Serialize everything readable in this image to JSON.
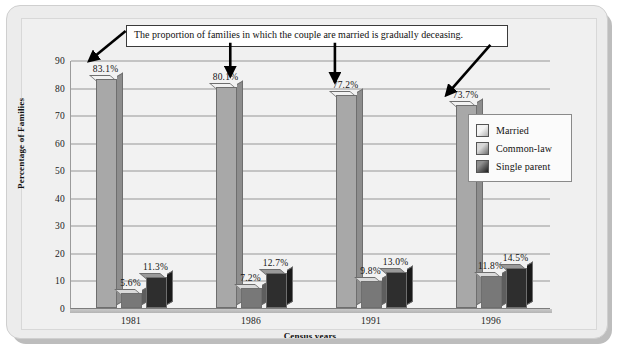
{
  "chart_data": {
    "type": "bar",
    "title": "",
    "xlabel": "Census years",
    "ylabel": "Percentage of Families",
    "categories": [
      "1981",
      "1986",
      "1991",
      "1996"
    ],
    "ylim": [
      0,
      90
    ],
    "yticks": [
      0,
      10,
      20,
      30,
      40,
      50,
      60,
      70,
      80,
      90
    ],
    "grid": true,
    "legend_position": "right",
    "series": [
      {
        "name": "Married",
        "color": "#a8a8a8",
        "values": [
          83.1,
          80.1,
          77.2,
          73.7
        ],
        "labels": [
          "83.1%",
          "80.1%",
          "77.2%",
          "73.7%"
        ]
      },
      {
        "name": "Common-law",
        "color": "#787878",
        "values": [
          5.6,
          7.2,
          9.8,
          11.8
        ],
        "labels": [
          "5.6%",
          "7.2%",
          "9.8%",
          "11.8%"
        ]
      },
      {
        "name": "Single parent",
        "color": "#2e2e2e",
        "values": [
          11.3,
          12.7,
          13.0,
          14.5
        ],
        "labels": [
          "11.3%",
          "12.7%",
          "13.0%",
          "14.5%"
        ]
      }
    ],
    "annotations": [
      {
        "text": "The proportion of families in which the couple are married is gradually deceasing.",
        "points_to": [
          "1981-married",
          "1986-married",
          "1991-married",
          "1996-married"
        ]
      }
    ]
  },
  "axis": {
    "y_ticks": [
      "90",
      "80",
      "70",
      "60",
      "50",
      "40",
      "30",
      "20",
      "10",
      "0"
    ],
    "y_title": "Percentage of Families",
    "x_ticks": [
      "1981",
      "1986",
      "1991",
      "1996"
    ],
    "x_title": "Census years"
  },
  "callout": {
    "text": "The proportion of families in which the couple are married is gradually deceasing."
  },
  "legend": {
    "items": [
      {
        "label": "Married"
      },
      {
        "label": "Common-law"
      },
      {
        "label": "Single parent"
      }
    ]
  },
  "bars": {
    "g1": {
      "married": "83.1%",
      "common": "5.6%",
      "single": "11.3%"
    },
    "g2": {
      "married": "80.1%",
      "common": "7.2%",
      "single": "12.7%"
    },
    "g3": {
      "married": "77.2%",
      "common": "9.8%",
      "single": "13.0%"
    },
    "g4": {
      "married": "73.7%",
      "common": "11.8%",
      "single": "14.5%"
    }
  },
  "colors": {
    "married": "#a8a8a8",
    "common_law": "#787878",
    "single_parent": "#2e2e2e",
    "grid": "#c4c4c4",
    "card_background": "#ececec",
    "plot_background": "#f2f2f2"
  }
}
